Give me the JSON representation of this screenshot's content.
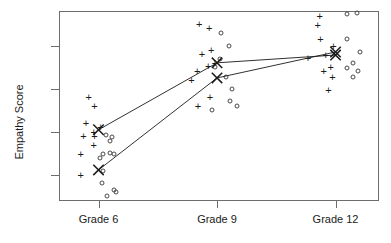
{
  "chart_data": {
    "type": "scatter",
    "title": "",
    "xlabel": "",
    "ylabel": "Empathy Score",
    "x_tick_labels": [
      "Grade 6",
      "Grade 9",
      "Grade 12"
    ],
    "x_tick_values": [
      6,
      9,
      12
    ],
    "y_ticks": [
      30,
      40,
      50,
      60
    ],
    "ylim": [
      24,
      68
    ],
    "grid": false,
    "legend": "none",
    "marker_styles": {
      "series_1": "plus",
      "series_2": "open-circle",
      "means": "bold-x"
    },
    "series": [
      {
        "name": "Group plus",
        "marker": "plus",
        "mean_line": true,
        "means": [
          {
            "grade": "Grade 6",
            "x": 6,
            "value": 40.5
          },
          {
            "grade": "Grade 9",
            "x": 9,
            "value": 56.0
          },
          {
            "grade": "Grade 12",
            "x": 12,
            "value": 57.8
          }
        ],
        "points": [
          {
            "x": 5.55,
            "y": 35.0
          },
          {
            "x": 5.55,
            "y": 30.0
          },
          {
            "x": 5.75,
            "y": 48.2
          },
          {
            "x": 5.9,
            "y": 46.0
          },
          {
            "x": 5.68,
            "y": 42.0
          },
          {
            "x": 5.62,
            "y": 39.0
          },
          {
            "x": 5.88,
            "y": 40.0
          },
          {
            "x": 5.9,
            "y": 39.0
          },
          {
            "x": 5.88,
            "y": 37.0
          },
          {
            "x": 6.05,
            "y": 41.2
          },
          {
            "x": 8.55,
            "y": 65.0
          },
          {
            "x": 8.8,
            "y": 64.0
          },
          {
            "x": 8.85,
            "y": 59.0
          },
          {
            "x": 8.62,
            "y": 58.0
          },
          {
            "x": 8.5,
            "y": 54.2
          },
          {
            "x": 8.78,
            "y": 55.2
          },
          {
            "x": 8.95,
            "y": 56.0
          },
          {
            "x": 8.82,
            "y": 48.0
          },
          {
            "x": 8.52,
            "y": 46.0
          },
          {
            "x": 8.35,
            "y": 52.0
          },
          {
            "x": 11.6,
            "y": 66.8
          },
          {
            "x": 11.55,
            "y": 64.8
          },
          {
            "x": 11.62,
            "y": 61.6
          },
          {
            "x": 11.95,
            "y": 59.8
          },
          {
            "x": 11.75,
            "y": 57.8
          },
          {
            "x": 11.88,
            "y": 55.0
          },
          {
            "x": 11.7,
            "y": 54.0
          },
          {
            "x": 11.92,
            "y": 52.8
          },
          {
            "x": 11.82,
            "y": 49.6
          },
          {
            "x": 11.3,
            "y": 57.2
          }
        ]
      },
      {
        "name": "Group circle",
        "marker": "open-circle",
        "mean_line": true,
        "means": [
          {
            "grade": "Grade 6",
            "x": 6,
            "value": 31.2
          },
          {
            "grade": "Grade 9",
            "x": 9,
            "value": 52.5
          },
          {
            "grade": "Grade 12",
            "x": 12,
            "value": 58.5
          }
        ],
        "points": [
          {
            "x": 6.2,
            "y": 39.2
          },
          {
            "x": 6.34,
            "y": 38.8
          },
          {
            "x": 6.3,
            "y": 38.0
          },
          {
            "x": 6.12,
            "y": 35.0
          },
          {
            "x": 6.3,
            "y": 35.2
          },
          {
            "x": 6.4,
            "y": 35.0
          },
          {
            "x": 6.05,
            "y": 34.0
          },
          {
            "x": 6.12,
            "y": 31.0
          },
          {
            "x": 6.1,
            "y": 28.2
          },
          {
            "x": 6.4,
            "y": 26.6
          },
          {
            "x": 6.45,
            "y": 26.2
          },
          {
            "x": 6.22,
            "y": 25.2
          },
          {
            "x": 9.1,
            "y": 62.8
          },
          {
            "x": 9.3,
            "y": 59.8
          },
          {
            "x": 9.08,
            "y": 57.0
          },
          {
            "x": 8.95,
            "y": 55.0
          },
          {
            "x": 9.22,
            "y": 52.8
          },
          {
            "x": 9.38,
            "y": 50.0
          },
          {
            "x": 9.32,
            "y": 47.2
          },
          {
            "x": 9.5,
            "y": 46.0
          },
          {
            "x": 8.88,
            "y": 45.0
          },
          {
            "x": 12.3,
            "y": 67.2
          },
          {
            "x": 12.55,
            "y": 67.6
          },
          {
            "x": 12.28,
            "y": 61.6
          },
          {
            "x": 12.62,
            "y": 58.4
          },
          {
            "x": 12.45,
            "y": 56.0
          },
          {
            "x": 12.3,
            "y": 54.8
          },
          {
            "x": 12.58,
            "y": 54.0
          },
          {
            "x": 12.45,
            "y": 52.8
          }
        ]
      }
    ]
  },
  "axis": {
    "y_label": "Empathy Score",
    "y_tick_labels": [
      "30",
      "40",
      "50",
      "60"
    ],
    "x_tick_labels": [
      "Grade 6",
      "Grade 9",
      "Grade 12"
    ]
  },
  "colors": {
    "axis": "#6d6d6d",
    "marker": "#1a1a1a",
    "circle": "#4a4a4a",
    "background": "#ffffff"
  }
}
